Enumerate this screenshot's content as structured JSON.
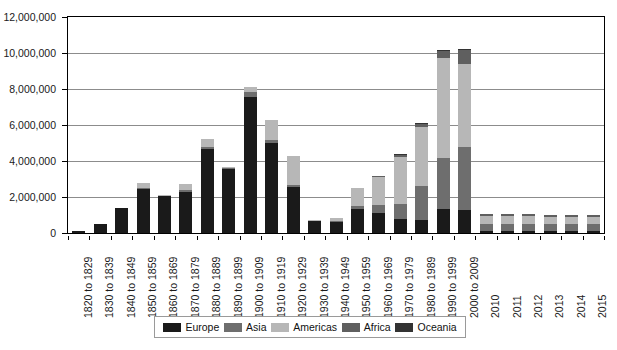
{
  "chart_data": {
    "type": "bar",
    "stacked": true,
    "title": "",
    "subtitle": "",
    "xlabel": "",
    "ylabel": "",
    "ylim": [
      0,
      12000000
    ],
    "ytick_labels": [
      "0",
      "2,000,000",
      "4,000,000",
      "6,000,000",
      "8,000,000",
      "10,000,000",
      "12,000,000"
    ],
    "ytick_values": [
      0,
      2000000,
      4000000,
      6000000,
      8000000,
      10000000,
      12000000
    ],
    "grid": "horizontal",
    "legend_position": "bottom",
    "categories": [
      "1820 to 1829",
      "1830 to 1839",
      "1840 to 1849",
      "1850 to 1859",
      "1860 to 1869",
      "1870 to 1879",
      "1880 to 1889",
      "1890 to 1899",
      "1900 to 1909",
      "1910 to 1919",
      "1920 to 1929",
      "1930 to 1939",
      "1940 to 1949",
      "1950 to 1959",
      "1960 to 1969",
      "1970 to 1979",
      "1980 to 1989",
      "1990 to 1999",
      "2000 to 2009",
      "2010",
      "2011",
      "2012",
      "2013",
      "2014",
      "2015"
    ],
    "series": [
      {
        "name": "Europe",
        "color": "#1a1a1a",
        "values": [
          98000,
          480000,
          1380000,
          2450000,
          2060000,
          2270000,
          4660000,
          3570000,
          7570000,
          4990000,
          2560000,
          640000,
          620000,
          1320000,
          1120000,
          800000,
          700000,
          1310000,
          1290000,
          95000,
          88000,
          86000,
          86000,
          86000,
          85000
        ]
      },
      {
        "name": "Asia",
        "color": "#6e6e6e",
        "values": [
          10000,
          10000,
          10000,
          50000,
          20000,
          130000,
          100000,
          50000,
          250000,
          200000,
          110000,
          20000,
          40000,
          160000,
          440000,
          820000,
          1900000,
          2880000,
          3510000,
          420000,
          440000,
          430000,
          400000,
          420000,
          420000
        ]
      },
      {
        "name": "Americas",
        "color": "#b7b7b7",
        "values": [
          20000,
          20000,
          20000,
          270000,
          30000,
          320000,
          440000,
          60000,
          300000,
          1090000,
          1610000,
          40000,
          170000,
          1000000,
          1560000,
          2630000,
          3300000,
          5520000,
          4610000,
          430000,
          420000,
          420000,
          400000,
          400000,
          390000
        ]
      },
      {
        "name": "Africa",
        "color": "#5f5f5f",
        "values": [
          0,
          0,
          0,
          0,
          0,
          0,
          0,
          0,
          10000,
          10000,
          10000,
          10000,
          10000,
          20000,
          40000,
          80000,
          180000,
          390000,
          760000,
          100000,
          100000,
          100000,
          100000,
          100000,
          100000
        ]
      },
      {
        "name": "Oceania",
        "color": "#333333",
        "values": [
          0,
          0,
          0,
          0,
          0,
          0,
          0,
          0,
          10000,
          10000,
          10000,
          0,
          0,
          10000,
          20000,
          40000,
          40000,
          60000,
          70000,
          10000,
          10000,
          10000,
          10000,
          10000,
          10000
        ]
      }
    ]
  },
  "legend": {
    "items": [
      {
        "label": "Europe",
        "color": "#1a1a1a"
      },
      {
        "label": "Asia",
        "color": "#6e6e6e"
      },
      {
        "label": "Americas",
        "color": "#b7b7b7"
      },
      {
        "label": "Africa",
        "color": "#5f5f5f"
      },
      {
        "label": "Oceania",
        "color": "#333333"
      }
    ]
  },
  "axis": {
    "grid_color": "#8c8c8c",
    "frame_color": "#000000"
  }
}
